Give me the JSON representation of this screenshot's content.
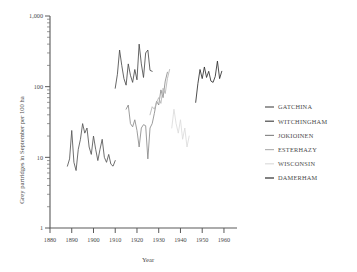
{
  "chart_data": {
    "type": "line",
    "title": "",
    "xlabel": "Year",
    "ylabel": "Grey partridges in September per 100 ha",
    "yscale": "log",
    "ylim": [
      1,
      1000
    ],
    "xlim": [
      1880,
      1966
    ],
    "grid": false,
    "legend_position": "right",
    "ytick_labels": [
      "1",
      "10",
      "100",
      "1,000"
    ],
    "ytick_values": [
      1,
      10,
      100,
      1000
    ],
    "xtick_labels": [
      "1880",
      "1890",
      "1900",
      "1910",
      "1920",
      "1930",
      "1940",
      "1950",
      "1960"
    ],
    "xtick_values": [
      1880,
      1890,
      1900,
      1910,
      1920,
      1930,
      1940,
      1950,
      1960
    ],
    "series": [
      {
        "name": "GATCHINA",
        "color": "#555555",
        "x": [
          1888,
          1889,
          1890,
          1891,
          1892,
          1893,
          1894,
          1895,
          1896,
          1897,
          1898,
          1899,
          1900,
          1901,
          1902,
          1903,
          1904,
          1905,
          1906,
          1907,
          1908,
          1909,
          1910
        ],
        "values": [
          7.5,
          9.5,
          24,
          8.5,
          6.5,
          13,
          18,
          30,
          22,
          26,
          14,
          11,
          20,
          13,
          9,
          13,
          18,
          10,
          8.5,
          11,
          8,
          7.5,
          9
        ]
      },
      {
        "name": "WITCHINGHAM",
        "color": "#4a4a4a",
        "x": [
          1910,
          1911,
          1912,
          1913,
          1914,
          1915,
          1916,
          1917,
          1918,
          1919,
          1920,
          1921,
          1922,
          1923,
          1924,
          1925,
          1926,
          1927
        ],
        "values": [
          95,
          150,
          330,
          200,
          130,
          105,
          210,
          145,
          115,
          175,
          125,
          400,
          210,
          135,
          300,
          330,
          170,
          165
        ]
      },
      {
        "name": "JOKIOINEN",
        "color": "#8a8a8a",
        "x": [
          1915,
          1916,
          1917,
          1918,
          1919,
          1920,
          1921,
          1922,
          1923,
          1924,
          1925,
          1926,
          1927,
          1928,
          1929,
          1930,
          1931,
          1932,
          1933,
          1934
        ],
        "values": [
          48,
          55,
          30,
          27,
          34,
          24,
          14,
          26,
          29,
          28,
          9.5,
          26,
          30,
          42,
          62,
          55,
          90,
          70,
          120,
          160
        ]
      },
      {
        "name": "ESTERHAZY",
        "color": "#b4b4b4",
        "x": [
          1926,
          1927,
          1928,
          1929,
          1930,
          1931,
          1932,
          1933,
          1934,
          1935
        ],
        "values": [
          40,
          52,
          48,
          60,
          70,
          58,
          95,
          80,
          130,
          175
        ]
      },
      {
        "name": "WISCONSIN",
        "color": "#dcdcdc",
        "x": [
          1936,
          1937,
          1938,
          1939,
          1940,
          1941,
          1942,
          1943,
          1944
        ],
        "values": [
          26,
          48,
          30,
          22,
          34,
          18,
          26,
          14,
          20
        ]
      },
      {
        "name": "DAMERHAM",
        "color": "#2e2e2e",
        "x": [
          1947,
          1948,
          1949,
          1950,
          1951,
          1952,
          1953,
          1954,
          1955,
          1956,
          1957,
          1958,
          1959
        ],
        "values": [
          60,
          110,
          175,
          130,
          190,
          135,
          165,
          120,
          115,
          140,
          230,
          130,
          165
        ]
      }
    ]
  },
  "legend": {
    "items": [
      {
        "label": "GATCHINA"
      },
      {
        "label": "WITCHINGHAM"
      },
      {
        "label": "JOKIOINEN"
      },
      {
        "label": "ESTERHAZY"
      },
      {
        "label": "WISCONSIN"
      },
      {
        "label": "DAMERHAM"
      }
    ]
  }
}
